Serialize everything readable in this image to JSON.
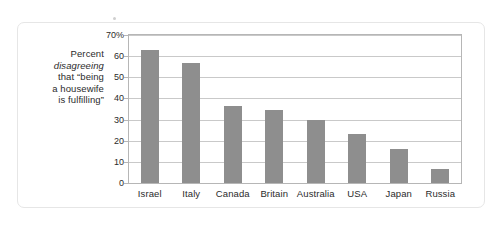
{
  "chart_data": {
    "type": "bar",
    "title": "",
    "subtitle": "",
    "xlabel": "",
    "ylabel": "Percent disagreeing that \"being a housewife is fulfilling\"",
    "ylabel_lines": [
      {
        "text": "Percent",
        "italic": false
      },
      {
        "text": "disagreeing",
        "italic": true
      },
      {
        "text": "that “being",
        "italic": false
      },
      {
        "text": "a housewife",
        "italic": false
      },
      {
        "text": "is fulfilling”",
        "italic": false
      }
    ],
    "categories": [
      "Israel",
      "Italy",
      "Canada",
      "Britain",
      "Australia",
      "USA",
      "Japan",
      "Russia"
    ],
    "values": [
      63,
      57,
      36.5,
      34.5,
      30,
      23,
      16,
      6.5
    ],
    "ylim": [
      0,
      70
    ],
    "ytick_values": [
      70,
      60,
      50,
      40,
      30,
      20,
      10,
      0
    ],
    "ytick_labels": [
      "70%",
      "60",
      "50",
      "40",
      "30",
      "20",
      "10",
      "0"
    ],
    "grid": true,
    "grid_axis": "y",
    "legend": false,
    "legend_position": "none",
    "bar_color": "#8e8e8e",
    "grid_color": "#c9c9c9",
    "frame_color": "#b6b6b6",
    "text_color": "#2b2b2b",
    "card_border_color": "#e6e6e6",
    "background_color": "#ffffff"
  }
}
